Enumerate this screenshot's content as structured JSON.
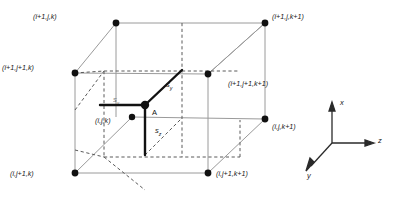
{
  "figure": {
    "type": "3d-cell-diagram"
  },
  "nodes": [
    {
      "id": "n-top-back-left",
      "label": "(i+1,j,k)",
      "px": 116,
      "py": 23,
      "label_x": 33,
      "label_y": 13,
      "label_anchor": "right"
    },
    {
      "id": "n-top-back-right",
      "label": "(i+1,j,k+1)",
      "px": 265,
      "py": 23,
      "label_x": 272,
      "label_y": 13,
      "label_anchor": "left"
    },
    {
      "id": "n-top-front-left",
      "label": "(i+1,j+1,k)",
      "px": 75,
      "py": 73,
      "label_x": 2,
      "label_y": 64,
      "label_anchor": "right"
    },
    {
      "id": "n-top-front-right",
      "label": "(i+1,j+1,k+1)",
      "px": 208,
      "py": 74,
      "label_x": 228,
      "label_y": 80,
      "label_anchor": "left"
    },
    {
      "id": "n-bot-back-left",
      "label": "(i,j,k)",
      "px": 132,
      "py": 117,
      "label_x": 95,
      "label_y": 117,
      "label_anchor": "right"
    },
    {
      "id": "n-bot-back-right",
      "label": "(i,j,k+1)",
      "px": 265,
      "py": 119,
      "label_x": 272,
      "label_y": 123,
      "label_anchor": "left"
    },
    {
      "id": "n-bot-front-left",
      "label": "(i,j+1,k)",
      "px": 75,
      "py": 173,
      "label_x": 10,
      "label_y": 170,
      "label_anchor": "right"
    },
    {
      "id": "n-bot-front-right",
      "label": "(i,j+1,k+1)",
      "px": 208,
      "py": 173,
      "label_x": 216,
      "label_y": 170,
      "label_anchor": "left"
    }
  ],
  "point_a": {
    "label": "A",
    "px": 145,
    "py": 105,
    "label_x": 152,
    "label_y": 110
  },
  "vectors": [
    {
      "id": "s-x",
      "label": "s",
      "subscript": "x",
      "from_x": 145,
      "from_y": 105,
      "to_x": 100,
      "to_y": 105,
      "label_x": 113,
      "label_y": 97
    },
    {
      "id": "s-y",
      "label": "s",
      "subscript": "y",
      "from_x": 145,
      "from_y": 105,
      "to_x": 182,
      "to_y": 70,
      "label_x": 166,
      "label_y": 84
    },
    {
      "id": "s-z",
      "label": "s",
      "subscript": "z",
      "from_x": 145,
      "from_y": 105,
      "to_x": 145,
      "to_y": 155,
      "label_x": 155,
      "label_y": 130
    }
  ],
  "axes": {
    "origin_x": 332,
    "origin_y": 143,
    "items": [
      {
        "id": "axis-x",
        "label": "x",
        "tip_x": 332,
        "tip_y": 105,
        "label_x": 340,
        "label_y": 100
      },
      {
        "id": "axis-z",
        "label": "z",
        "tip_x": 372,
        "tip_y": 143,
        "label_x": 378,
        "label_y": 137
      },
      {
        "id": "axis-y",
        "label": "y",
        "tip_x": 307,
        "tip_y": 170,
        "label_x": 308,
        "label_y": 172
      }
    ]
  },
  "colors": {
    "solid_edge": "#9a9a9a",
    "hidden_edge": "#5a5a5a",
    "bold_vector": "#111111",
    "node_fill": "#111111",
    "axis": "#2a2a2a",
    "background": "#ffffff"
  }
}
